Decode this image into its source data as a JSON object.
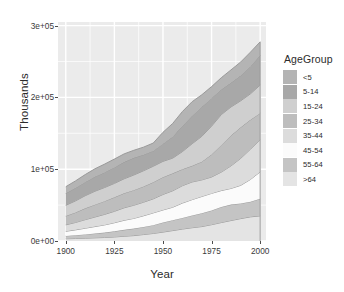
{
  "chart_data": {
    "type": "area",
    "stacked": true,
    "title": "",
    "xlabel": "Year",
    "ylabel": "Thousands",
    "x": [
      1900,
      1905,
      1910,
      1915,
      1920,
      1925,
      1930,
      1935,
      1940,
      1945,
      1950,
      1955,
      1960,
      1965,
      1970,
      1975,
      1980,
      1985,
      1990,
      1995,
      2000
    ],
    "xlim": [
      1896,
      2003
    ],
    "ylim": [
      0,
      305000
    ],
    "xticks": [
      1900,
      1925,
      1950,
      1975,
      2000
    ],
    "xticklabels": [
      "1900",
      "1925",
      "1950",
      "1975",
      "2000"
    ],
    "yticks": [
      0,
      100000,
      200000,
      300000
    ],
    "yticklabels": [
      "0e+00",
      "1e+05",
      "2e+05",
      "3e+05"
    ],
    "grid": true,
    "grid_color": "#ffffff",
    "panel_background": "#ebebeb",
    "legend_position": "right",
    "legend_title": "AgeGroup",
    "series": [
      {
        "name": "<5",
        "color": "#b4b4b4",
        "values": [
          9200,
          9900,
          10600,
          11200,
          11600,
          11700,
          11400,
          10500,
          10600,
          11000,
          16200,
          18600,
          20300,
          19800,
          17200,
          16100,
          16500,
          18000,
          18900,
          19600,
          19200
        ]
      },
      {
        "name": "5-14",
        "color": "#a8a8a8",
        "values": [
          16700,
          17900,
          18800,
          20100,
          21000,
          22200,
          23300,
          23900,
          22300,
          21300,
          24300,
          29700,
          35500,
          38700,
          40700,
          38900,
          34900,
          33600,
          35100,
          38400,
          41000
        ]
      },
      {
        "name": "15-24",
        "color": "#cfcfcf",
        "values": [
          14900,
          16200,
          17600,
          18700,
          19000,
          19400,
          20100,
          21100,
          21900,
          22300,
          22100,
          21200,
          24600,
          30800,
          35400,
          39600,
          42500,
          39900,
          37000,
          36200,
          39200
        ]
      },
      {
        "name": "25-34",
        "color": "#bdbdbd",
        "values": [
          12300,
          13900,
          15800,
          17200,
          18400,
          19500,
          20300,
          21000,
          21900,
          23100,
          24000,
          24300,
          22900,
          22500,
          25300,
          31300,
          37600,
          42200,
          43200,
          40900,
          37200
        ]
      },
      {
        "name": "35-44",
        "color": "#dcdcdc",
        "values": [
          9000,
          10300,
          11900,
          13300,
          14700,
          15900,
          17400,
          18300,
          18900,
          19600,
          21600,
          22900,
          24200,
          24600,
          23100,
          22800,
          25700,
          31400,
          37600,
          42200,
          44500
        ]
      },
      {
        "name": "45-54",
        "color": "#fbfbfb",
        "values": [
          6400,
          7400,
          8600,
          9700,
          10700,
          11900,
          13300,
          14200,
          15500,
          17000,
          17400,
          18000,
          20600,
          22000,
          23300,
          23800,
          22800,
          22500,
          25200,
          31000,
          37400
        ]
      },
      {
        "name": "55-64",
        "color": "#c4c4c4",
        "values": [
          4000,
          4600,
          5300,
          6000,
          6800,
          7900,
          8900,
          9800,
          10600,
          11600,
          13400,
          14500,
          15600,
          17100,
          18600,
          19800,
          21700,
          22200,
          21100,
          21100,
          23900
        ]
      },
      {
        "name": ">64",
        "color": "#e4e4e4",
        "values": [
          3100,
          3500,
          3900,
          4400,
          4900,
          5600,
          6600,
          7500,
          9000,
          10500,
          12400,
          14500,
          16600,
          18500,
          20100,
          22700,
          25700,
          28500,
          31200,
          33600,
          35000
        ]
      }
    ],
    "totals_note": "stacked totals rise from about 7.6e+04 in 1900 to about 2.77e+05 in 2000"
  },
  "axes": {
    "y_title": "Thousands",
    "x_title": "Year",
    "y_ticks": [
      {
        "label": "0e+00",
        "value": 0
      },
      {
        "label": "1e+05",
        "value": 100000
      },
      {
        "label": "2e+05",
        "value": 200000
      },
      {
        "label": "3e+05",
        "value": 300000
      }
    ],
    "x_ticks": [
      {
        "label": "1900",
        "value": 1900
      },
      {
        "label": "1925",
        "value": 1925
      },
      {
        "label": "1950",
        "value": 1950
      },
      {
        "label": "1975",
        "value": 1975
      },
      {
        "label": "2000",
        "value": 2000
      }
    ]
  },
  "legend": {
    "title": "AgeGroup",
    "items": [
      {
        "label": "<5",
        "color": "#b4b4b4"
      },
      {
        "label": "5-14",
        "color": "#a8a8a8"
      },
      {
        "label": "15-24",
        "color": "#cfcfcf"
      },
      {
        "label": "25-34",
        "color": "#bdbdbd"
      },
      {
        "label": "35-44",
        "color": "#dcdcdc"
      },
      {
        "label": "45-54",
        "color": "#fbfbfb"
      },
      {
        "label": "55-64",
        "color": "#c4c4c4"
      },
      {
        "label": ">64",
        "color": "#e4e4e4"
      }
    ]
  },
  "style": {
    "panel_background": "#ebebeb",
    "grid_color": "#ffffff",
    "band_outline": "#9a9a9a",
    "text_color": "#2b2b2b"
  }
}
